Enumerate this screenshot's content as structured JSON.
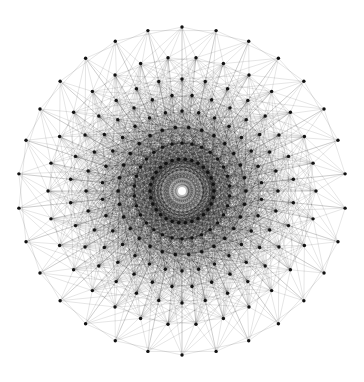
{
  "diagram": {
    "symmetry": 30,
    "center": [
      182,
      191
    ],
    "rings": [
      {
        "radius": 164,
        "offset_deg": 6
      },
      {
        "radius": 134,
        "offset_deg": 0
      },
      {
        "radius": 112,
        "offset_deg": 6
      },
      {
        "radius": 96,
        "offset_deg": 0
      },
      {
        "radius": 80,
        "offset_deg": 6
      },
      {
        "radius": 64,
        "offset_deg": 0
      },
      {
        "radius": 48,
        "offset_deg": 6
      },
      {
        "radius": 32,
        "offset_deg": 0
      }
    ],
    "colors": {
      "edge": "#000000",
      "vertex": "#111111",
      "center": "#ffffff"
    }
  }
}
